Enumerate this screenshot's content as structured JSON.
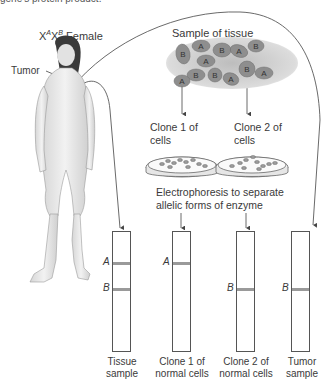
{
  "header_fragment": "gene's protein product.",
  "female_label": {
    "prefix": "X",
    "sup1": "A",
    "mid": "X",
    "sup2": "B",
    "suffix": " Female"
  },
  "tumor_label": "Tumor",
  "tissue_sample_label": "Sample of tissue",
  "tissue_cells": [
    "B",
    "A",
    "B",
    "A",
    "B",
    "A",
    "B",
    "B",
    "A",
    "B",
    "A",
    "A"
  ],
  "clone1_label": [
    "Clone 1 of",
    "cells"
  ],
  "clone2_label": [
    "Clone 2 of",
    "cells"
  ],
  "electrophoresis_label": [
    "Electrophoresis to separate",
    "allelic forms of enzyme"
  ],
  "gels": [
    {
      "name": "tissue-sample",
      "caption": [
        "Tissue",
        "sample"
      ],
      "bands": [
        "A",
        "B"
      ]
    },
    {
      "name": "clone-1",
      "caption": [
        "Clone 1 of",
        "normal cells"
      ],
      "bands": [
        "A"
      ]
    },
    {
      "name": "clone-2",
      "caption": [
        "Clone 2 of",
        "normal cells"
      ],
      "bands": [
        "B"
      ]
    },
    {
      "name": "tumor-sample",
      "caption": [
        "Tumor",
        "sample"
      ],
      "bands": [
        "B"
      ]
    }
  ],
  "colors": {
    "band": "#9a9a9a",
    "line": "#444444",
    "cell": "#8e8e8e",
    "tissue_bg": "#cfcfcf"
  }
}
